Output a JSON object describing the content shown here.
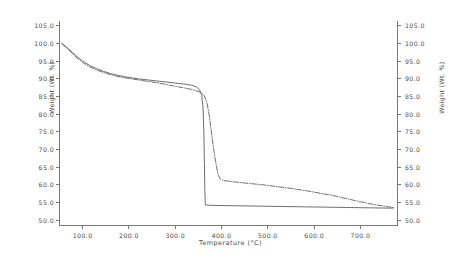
{
  "chart_data": {
    "type": "line",
    "title": "",
    "xlabel": "Temperature (°C)",
    "ylabel": "Weight (Wt. %)",
    "ylabel_right": "Weight (Wt. %)",
    "xlim": [
      50,
      780
    ],
    "ylim": [
      48.5,
      106.5
    ],
    "xticks": [
      100.0,
      200.0,
      300.0,
      400.0,
      500.0,
      600.0,
      700.0
    ],
    "xtick_labels": [
      "100.0",
      "200.0",
      "300.0",
      "400.0",
      "500.0",
      "600.0",
      "700.0"
    ],
    "yticks": [
      50.0,
      55.0,
      60.0,
      65.0,
      70.0,
      75.0,
      80.0,
      85.0,
      90.0,
      95.0,
      100.0,
      105.0
    ],
    "ytick_labels": [
      "50.0",
      "55.0",
      "60.0",
      "65.0",
      "70.0",
      "75.0",
      "80.0",
      "85.0",
      "90.0",
      "95.0",
      "100.0",
      "105.0"
    ],
    "grid": false,
    "legend": "none",
    "series": [
      {
        "name": "solid-curve",
        "style": "solid",
        "color": "#555555",
        "points": [
          [
            55,
            100.0
          ],
          [
            70,
            98.4
          ],
          [
            85,
            96.6
          ],
          [
            100,
            95.0
          ],
          [
            115,
            93.8
          ],
          [
            130,
            92.9
          ],
          [
            145,
            92.1
          ],
          [
            160,
            91.5
          ],
          [
            175,
            91.0
          ],
          [
            190,
            90.6
          ],
          [
            205,
            90.3
          ],
          [
            220,
            90.0
          ],
          [
            240,
            89.7
          ],
          [
            260,
            89.4
          ],
          [
            280,
            89.1
          ],
          [
            300,
            88.8
          ],
          [
            320,
            88.5
          ],
          [
            335,
            88.2
          ],
          [
            345,
            87.8
          ],
          [
            352,
            87.0
          ],
          [
            357,
            85.5
          ],
          [
            360,
            82.0
          ],
          [
            362,
            74.0
          ],
          [
            363,
            66.0
          ],
          [
            364,
            58.0
          ],
          [
            365,
            54.3
          ],
          [
            380,
            54.2
          ],
          [
            420,
            54.1
          ],
          [
            470,
            54.0
          ],
          [
            520,
            53.9
          ],
          [
            570,
            53.8
          ],
          [
            620,
            53.7
          ],
          [
            670,
            53.6
          ],
          [
            720,
            53.5
          ],
          [
            770,
            53.4
          ]
        ]
      },
      {
        "name": "dash-dot-curve",
        "style": "dashdot",
        "color": "#555555",
        "points": [
          [
            55,
            100.0
          ],
          [
            70,
            98.2
          ],
          [
            85,
            96.2
          ],
          [
            100,
            94.6
          ],
          [
            115,
            93.4
          ],
          [
            130,
            92.5
          ],
          [
            145,
            91.8
          ],
          [
            160,
            91.2
          ],
          [
            175,
            90.7
          ],
          [
            190,
            90.3
          ],
          [
            205,
            90.0
          ],
          [
            220,
            89.7
          ],
          [
            240,
            89.3
          ],
          [
            260,
            88.9
          ],
          [
            280,
            88.4
          ],
          [
            300,
            87.9
          ],
          [
            320,
            87.4
          ],
          [
            335,
            87.0
          ],
          [
            345,
            86.6
          ],
          [
            355,
            86.2
          ],
          [
            362,
            85.4
          ],
          [
            368,
            83.5
          ],
          [
            373,
            80.0
          ],
          [
            378,
            75.0
          ],
          [
            383,
            70.0
          ],
          [
            388,
            66.0
          ],
          [
            392,
            63.2
          ],
          [
            396,
            61.8
          ],
          [
            402,
            61.3
          ],
          [
            412,
            61.1
          ],
          [
            430,
            60.8
          ],
          [
            460,
            60.4
          ],
          [
            490,
            60.0
          ],
          [
            520,
            59.5
          ],
          [
            550,
            59.0
          ],
          [
            580,
            58.4
          ],
          [
            610,
            57.7
          ],
          [
            640,
            57.0
          ],
          [
            670,
            56.1
          ],
          [
            700,
            55.2
          ],
          [
            730,
            54.4
          ],
          [
            760,
            53.8
          ],
          [
            775,
            53.5
          ]
        ]
      }
    ]
  },
  "axes": {
    "frame_color": "#6a6a6a",
    "line_color": "#555555"
  }
}
